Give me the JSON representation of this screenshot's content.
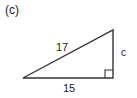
{
  "figure": {
    "part_label": "(c)",
    "shape": "right-triangle",
    "stroke_color": "#333333",
    "background_color": "#ffffff",
    "right_angle_marker": true,
    "right_angle_vertex": "bottom-right",
    "labels": {
      "hypotenuse": "17",
      "vertical_leg": "c",
      "horizontal_leg": "15"
    },
    "geometry": {
      "left_vertex_x": 23,
      "left_vertex_y": 78,
      "bottom_right_vertex_x": 113,
      "bottom_right_vertex_y": 78,
      "top_right_vertex_x": 113,
      "top_right_vertex_y": 30,
      "right_angle_marker_size": 8
    }
  }
}
